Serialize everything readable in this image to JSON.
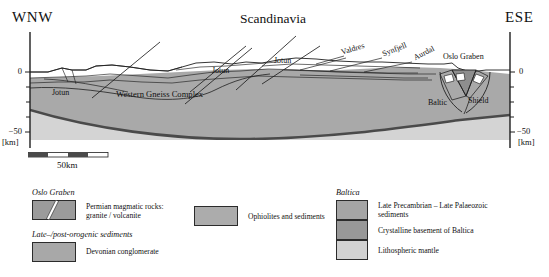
{
  "figure": {
    "type": "geological-cross-section",
    "title": "Scandinavia",
    "direction_left": "WNW",
    "direction_right": "ESE"
  },
  "axes": {
    "left": {
      "top_tick": "0",
      "bottom_tick": "−50",
      "unit": "[km]"
    },
    "right": {
      "top_tick": "0",
      "bottom_tick": "−50",
      "unit": "[km]"
    }
  },
  "scale_bar": {
    "label": "50km",
    "segments": 4
  },
  "section_labels": [
    {
      "text": "Jotun",
      "x": 55,
      "y": 93
    },
    {
      "text": "Western Gneiss Complex",
      "x": 118,
      "y": 95
    },
    {
      "text": "Jotun",
      "x": 213,
      "y": 71
    },
    {
      "text": "Jotun",
      "x": 275,
      "y": 61
    },
    {
      "text": "Valdres",
      "x": 348,
      "y": 53,
      "rotate": -18
    },
    {
      "text": "Synfjell",
      "x": 385,
      "y": 53,
      "rotate": -22
    },
    {
      "text": "Aurdal",
      "x": 414,
      "y": 57,
      "rotate": -26
    },
    {
      "text": "Oslo Graben",
      "x": 443,
      "y": 56
    },
    {
      "text": "Baltic",
      "x": 430,
      "y": 103
    },
    {
      "text": "Shield",
      "x": 470,
      "y": 101
    }
  ],
  "legend": {
    "groups": [
      {
        "name": "oslo-graben",
        "header": "Oslo Graben",
        "items": [
          {
            "label": "Permian magmatic rocks:\ngranite / volcanite",
            "color": "#9b9b9b",
            "has_dike": true
          }
        ]
      },
      {
        "name": "late-post-orogenic",
        "header": "Late–/post-orogenic sediments",
        "items": [
          {
            "label": "Devonian conglomerate",
            "color": "#a8a8a8",
            "has_dike": false
          }
        ]
      },
      {
        "name": "ophiolites",
        "header": "",
        "items": [
          {
            "label": "Ophiolites and sediments",
            "color": "#acacac",
            "has_dike": false
          }
        ]
      },
      {
        "name": "baltica",
        "header": "Baltica",
        "items": [
          {
            "label": "Late Precambrian – Late Palaeozoic\nsediments",
            "color": "#a5a5a5",
            "has_dike": false
          },
          {
            "label": "Crystalline basement of Baltica",
            "color": "#989898",
            "has_dike": false
          },
          {
            "label": "Lithospheric mantle",
            "color": "#d2d2d2",
            "has_dike": false
          }
        ]
      }
    ]
  },
  "colors": {
    "crust": "#a9a9a9",
    "mantle": "#d4d4d4",
    "nappe": "#a0a0a0",
    "graben_fill": "#8e8e8e",
    "line": "#1f1f1f",
    "moho": "#4a4a4a",
    "background": "#ffffff"
  }
}
